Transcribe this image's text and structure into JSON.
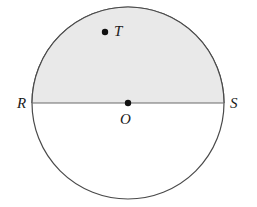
{
  "figure": {
    "kind": "circle-diagram",
    "background_color": "#ffffff",
    "circle": {
      "center_x": 128,
      "center_y": 103,
      "radius": 96,
      "stroke_color": "#4a4a4a",
      "stroke_width": 1.2,
      "fill_color": "#ffffff"
    },
    "shaded_region": {
      "name": "upper-semicircle",
      "fill_color": "#e9e9e9",
      "description": "upper half bounded by diameter RS and arc RTS"
    },
    "diameter": {
      "name": "RS",
      "x1": 32,
      "y1": 103,
      "x2": 224,
      "y2": 103,
      "stroke_color": "#6a6a6a",
      "stroke_width": 1.2
    },
    "dots": [
      {
        "name": "center-dot",
        "label": "O",
        "x": 128,
        "y": 103,
        "radius": 3.2,
        "color": "#111111"
      },
      {
        "name": "point-t-dot",
        "label": "T",
        "x": 105,
        "y": 32,
        "radius": 3.2,
        "color": "#111111"
      }
    ],
    "labels": [
      {
        "name": "R",
        "text": "R",
        "x": 17,
        "y": 96,
        "position": "left-outside"
      },
      {
        "name": "S",
        "text": "S",
        "x": 230,
        "y": 96,
        "position": "right-outside"
      },
      {
        "name": "T",
        "text": "T",
        "x": 114,
        "y": 24,
        "position": "right-of-dot"
      },
      {
        "name": "O",
        "text": "O",
        "x": 120,
        "y": 112,
        "position": "below-center-dot"
      }
    ]
  }
}
